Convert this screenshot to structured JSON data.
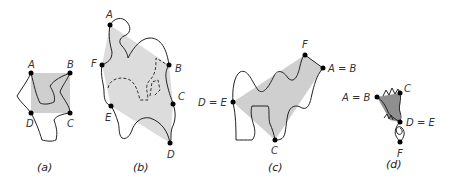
{
  "figure": {
    "panels": [
      {
        "id": "a",
        "caption": "(a)",
        "fill": "#cfcfcf",
        "vertices": [
          {
            "label": "A",
            "x": 31,
            "y": 73
          },
          {
            "label": "B",
            "x": 70,
            "y": 73
          },
          {
            "label": "C",
            "x": 70,
            "y": 113
          },
          {
            "label": "D",
            "x": 31,
            "y": 113
          }
        ]
      },
      {
        "id": "b",
        "caption": "(b)",
        "fill": "#dcdcdc",
        "vertices": [
          {
            "label": "A",
            "x": 110,
            "y": 25
          },
          {
            "label": "B",
            "x": 169,
            "y": 65
          },
          {
            "label": "C",
            "x": 173,
            "y": 104
          },
          {
            "label": "D",
            "x": 170,
            "y": 143
          },
          {
            "label": "E",
            "x": 111,
            "y": 106
          },
          {
            "label": "F",
            "x": 102,
            "y": 65
          }
        ]
      },
      {
        "id": "c",
        "caption": "(c)",
        "fill": "#cfcfcf",
        "vertices": [
          {
            "label": "F",
            "x": 305,
            "y": 55
          },
          {
            "label": "A = B",
            "x": 323,
            "y": 68
          },
          {
            "label": "C",
            "x": 275,
            "y": 140
          },
          {
            "label": "D = E",
            "x": 233,
            "y": 102
          }
        ]
      },
      {
        "id": "d",
        "caption": "(d)",
        "fill": "#8f8f8f",
        "vertices": [
          {
            "label": "C",
            "x": 400,
            "y": 93
          },
          {
            "label": "A = B",
            "x": 377,
            "y": 97
          },
          {
            "label": "D = E",
            "x": 400,
            "y": 122
          },
          {
            "label": "F",
            "x": 400,
            "y": 142
          }
        ]
      }
    ]
  }
}
